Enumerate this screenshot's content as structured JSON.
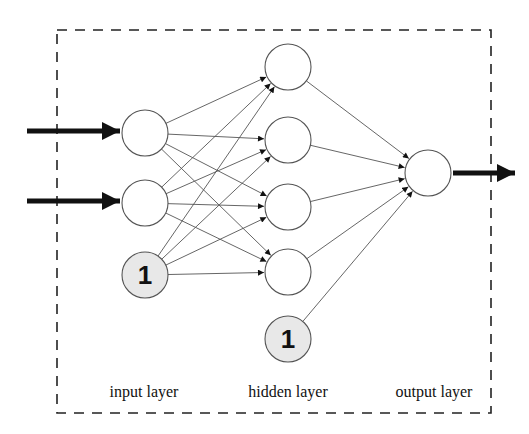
{
  "diagram": {
    "type": "feed-forward neural network",
    "colors": {
      "stroke": "#555555",
      "arrow": "#111111",
      "node_fill": "#ffffff",
      "bias_fill": "#e8e8e8",
      "border": "#222222"
    },
    "layers": {
      "input": {
        "label": "input layer",
        "nodes": [
          {
            "id": "i1",
            "cx": 145,
            "cy": 133,
            "bias": false
          },
          {
            "id": "i2",
            "cx": 145,
            "cy": 203,
            "bias": false
          },
          {
            "id": "ib",
            "cx": 145,
            "cy": 275,
            "bias": true,
            "text": "1"
          }
        ]
      },
      "hidden": {
        "label": "hidden layer",
        "nodes": [
          {
            "id": "h1",
            "cx": 288,
            "cy": 67,
            "bias": false
          },
          {
            "id": "h2",
            "cx": 288,
            "cy": 140,
            "bias": false
          },
          {
            "id": "h3",
            "cx": 288,
            "cy": 207,
            "bias": false
          },
          {
            "id": "h4",
            "cx": 288,
            "cy": 272,
            "bias": false
          },
          {
            "id": "hb",
            "cx": 288,
            "cy": 339,
            "bias": true,
            "text": "1"
          }
        ]
      },
      "output": {
        "label": "output layer",
        "nodes": [
          {
            "id": "o1",
            "cx": 428,
            "cy": 173,
            "bias": false
          }
        ]
      }
    },
    "node_radius": 23,
    "external_inputs": [
      {
        "x1": 27,
        "y1": 131,
        "x2": 120,
        "y2": 131
      },
      {
        "x1": 27,
        "y1": 201,
        "x2": 120,
        "y2": 201
      }
    ],
    "external_output": {
      "x1": 453,
      "y1": 173,
      "x2": 515,
      "y2": 173
    },
    "border": {
      "x": 57,
      "y": 30,
      "width": 434,
      "height": 383
    },
    "labels": [
      {
        "text": "input layer",
        "x": 144,
        "y": 397
      },
      {
        "text": "hidden layer",
        "x": 288,
        "y": 397
      },
      {
        "text": "output layer",
        "x": 434,
        "y": 397
      }
    ]
  }
}
